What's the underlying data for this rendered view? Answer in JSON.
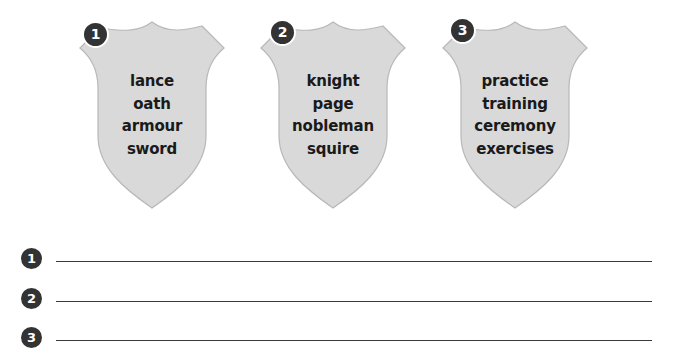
{
  "shields": [
    {
      "number": "1",
      "words": [
        "lance",
        "oath",
        "armour",
        "sword"
      ]
    },
    {
      "number": "2",
      "words": [
        "knight",
        "page",
        "nobleman",
        "squire"
      ]
    },
    {
      "number": "3",
      "words": [
        "practice",
        "training",
        "ceremony",
        "exercises"
      ]
    }
  ],
  "answer_lines": [
    {
      "number": "1",
      "value": ""
    },
    {
      "number": "2",
      "value": ""
    },
    {
      "number": "3",
      "value": ""
    }
  ],
  "colors": {
    "shield_fill": "#d9d9d9",
    "shield_edge": "#b8b8b8",
    "badge": "#333333",
    "text": "#1a1a1a",
    "line": "#3a3a3a"
  }
}
